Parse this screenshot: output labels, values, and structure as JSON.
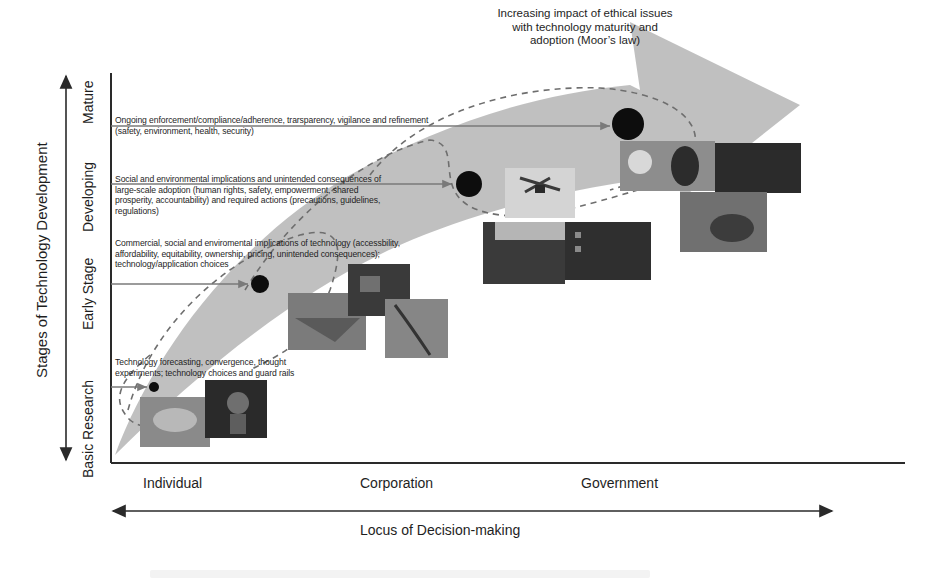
{
  "diagram": {
    "headline": {
      "lines": [
        "Increasing impact of ethical issues",
        "with technology maturity and",
        "adoption (Moor’s law)"
      ]
    },
    "y_axis": {
      "title": "Stages of Technology Development",
      "stages": [
        "Basic Research",
        "Early Stage",
        "Developing",
        "Mature"
      ]
    },
    "x_axis": {
      "title": "Locus of Decision-making",
      "categories": [
        "Individual",
        "Corporation",
        "Government"
      ]
    },
    "stage_descriptions": [
      {
        "stage": "Mature",
        "lines": [
          "Ongoing enforcement/compliance/adherence, trarsparency, vigilance and refinement",
          "(safety, environment, health, security)"
        ]
      },
      {
        "stage": "Developing",
        "lines": [
          "Social and environmental implications and unintended consequences of",
          "large-scale adoption (human rights, safety, empowerment, shared",
          "prosperity, accountability) and required actions (precautions, guidelines,",
          "regulations)"
        ]
      },
      {
        "stage": "Early Stage",
        "lines": [
          "Commercial, social and enviromental implications of technology (accessbility,",
          "affordability, equitability, ownership, pricing, unintended consequences);",
          "technology/application choices"
        ]
      },
      {
        "stage": "Basic Research",
        "lines": [
          "Technology forecasting, convergence, thought",
          "experiments; technology choices and guard rails"
        ]
      }
    ],
    "markers": [
      {
        "stage": "Basic Research",
        "size": "small"
      },
      {
        "stage": "Early Stage",
        "size": "medium"
      },
      {
        "stage": "Developing",
        "size": "large"
      },
      {
        "stage": "Mature",
        "size": "x-large"
      }
    ],
    "photo_groups": [
      {
        "stage": "Basic Research",
        "count": 2
      },
      {
        "stage": "Early Stage",
        "count": 3
      },
      {
        "stage": "Developing",
        "count": 3
      },
      {
        "stage": "Mature",
        "count": 3
      }
    ],
    "colors": {
      "big_arrow": "#bdbdbd",
      "axis": "#2a2a2a",
      "marker": "#0d0d0d",
      "dashed_curve": "#6e6e6e",
      "text": "#1e1e1e"
    }
  }
}
